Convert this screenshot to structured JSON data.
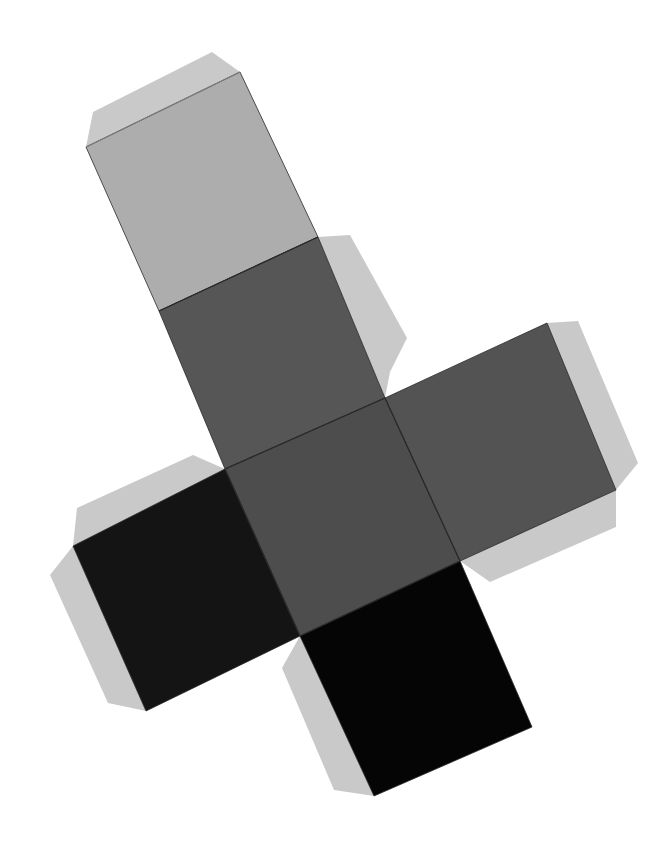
{
  "image": {
    "description": "Grayscale paper cutout of an unfolded cube net: six square faces in a cross arrangement, rotated about 25 degrees, with lighter glue tabs along outer edges",
    "background": "#ffffff"
  },
  "colors": {
    "tab": "#c9c9c9",
    "tab_edge": "#b5b5b5",
    "face_top_light": "#adadad",
    "face_upper_dark": "#565656",
    "face_center": "#4d4d4d",
    "face_right": "#535353",
    "face_left": "#141414",
    "face_bottom": "#050505",
    "fold_line": "#2a2a2a",
    "top_tab_fold": "#7d7d7d"
  },
  "net": {
    "faces": [
      {
        "name": "face-top-light",
        "points": "86,147 240,72 318,237 159,311"
      },
      {
        "name": "face-upper-dark",
        "points": "159,311 318,237 385,398 225,469"
      },
      {
        "name": "face-center",
        "points": "225,469 385,398 460,561 300,636"
      },
      {
        "name": "face-right",
        "points": "385,398 547,323 616,490 460,561"
      },
      {
        "name": "face-left",
        "points": "73,546 225,469 300,636 146,711"
      },
      {
        "name": "face-bottom",
        "points": "300,636 460,561 532,727 374,796"
      }
    ],
    "tabs": [
      {
        "name": "tab-top",
        "points": "86,147 93,112 212,52 240,72"
      },
      {
        "name": "tab-upper-right",
        "points": "318,237 350,235 407,338 390,372 385,398"
      },
      {
        "name": "tab-right",
        "points": "547,323 578,321 638,463 616,490"
      },
      {
        "name": "tab-right-bottom",
        "points": "460,561 490,582 616,527 616,490"
      },
      {
        "name": "tab-left-top",
        "points": "73,546 77,508 193,455 218,466 225,469"
      },
      {
        "name": "tab-left",
        "points": "73,546 50,575 108,703 146,711"
      },
      {
        "name": "tab-bottom",
        "points": "300,636 282,668 334,790 374,796"
      }
    ]
  }
}
